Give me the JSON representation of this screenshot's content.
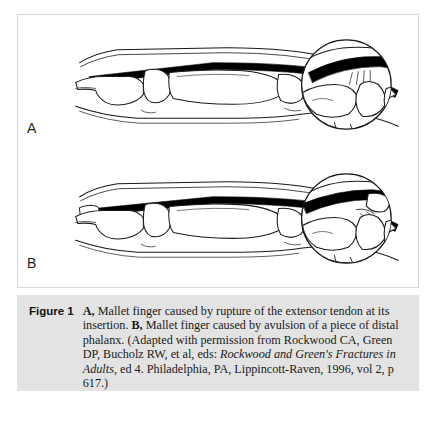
{
  "figure": {
    "number_label": "Figure 1",
    "panels": [
      {
        "letter": "A",
        "subject": "mallet finger caused by tendon rupture"
      },
      {
        "letter": "B",
        "subject": "mallet finger caused by bone avulsion"
      }
    ],
    "caption": {
      "panel_a_marker": "A,",
      "panel_a_text": " Mallet finger caused by rupture of the extensor tendon at its insertion. ",
      "panel_b_marker": "B,",
      "panel_b_text": " Mallet finger caused by avulsion of a piece of distal phalanx. (Adapted with permission from Rockwood CA, Green DP, Bucholz RW, et al, eds: ",
      "source_title_italic": "Rockwood and Green's Fractures in Adults",
      "source_tail": ", ed 4. Philadelphia, PA, Lippincott-Raven, 1996, vol 2, p 617.)"
    }
  },
  "colors": {
    "page_background": "#ffffff",
    "caption_background": "#e3e3e3",
    "panel_border": "#d8d8d8",
    "line_art": "#1a1a1a",
    "tendon_fill": "#000000",
    "bone_fill": "#ffffff",
    "caption_text": "#1a1a1a"
  }
}
